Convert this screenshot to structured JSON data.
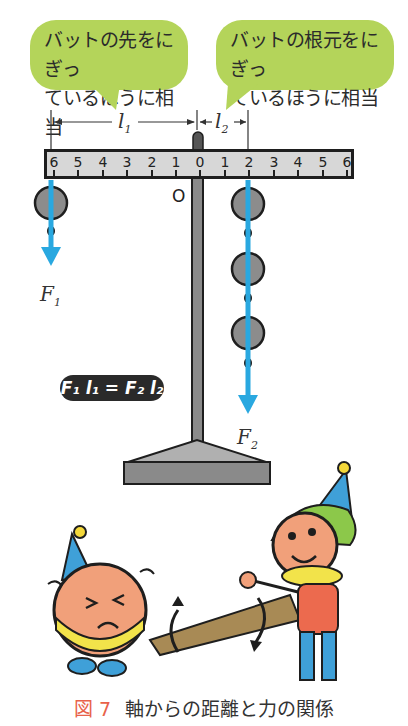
{
  "bubbles": {
    "left": {
      "line1": "バットの先をにぎっ",
      "line2": "ているほうに相当",
      "color": "#b4d45a"
    },
    "right": {
      "line1": "バットの根元をにぎっ",
      "line2": "ているほうに相当",
      "color": "#b4d45a"
    }
  },
  "dimensions": {
    "l1": "l",
    "l1_sub": "1",
    "l2": "l",
    "l2_sub": "2"
  },
  "ruler": {
    "ticks": [
      "6",
      "5",
      "4",
      "3",
      "2",
      "1",
      "0",
      "1",
      "2",
      "3",
      "4",
      "5",
      "6"
    ],
    "pivot_label": "O"
  },
  "forces": {
    "f1": {
      "label": "F",
      "sub": "1",
      "weights": 1,
      "position": 6,
      "side": "left"
    },
    "f2": {
      "label": "F",
      "sub": "2",
      "weights": 3,
      "position": 2,
      "side": "right"
    },
    "arrow_color": "#29a8e0"
  },
  "formula": "F₁ l₁ = F₂ l₂",
  "caption": {
    "figure": "図 7",
    "text": "軸からの距離と力の関係",
    "figure_color": "#e8624a"
  }
}
